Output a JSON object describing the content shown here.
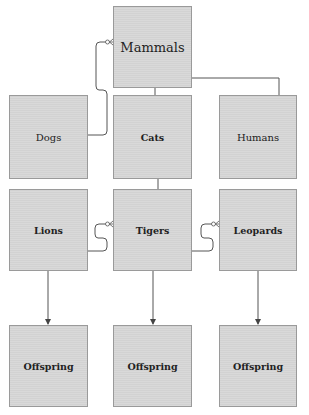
{
  "diagram": {
    "nodes": [
      {
        "id": "mammals",
        "label": "Mammals",
        "style": "title"
      },
      {
        "id": "dogs",
        "label": "Dogs",
        "style": "plain"
      },
      {
        "id": "cats",
        "label": "Cats",
        "style": "bold"
      },
      {
        "id": "humans",
        "label": "Humans",
        "style": "plain"
      },
      {
        "id": "lions",
        "label": "Lions",
        "style": "bold"
      },
      {
        "id": "tigers",
        "label": "Tigers",
        "style": "bold"
      },
      {
        "id": "leopards",
        "label": "Leopards",
        "style": "bold"
      },
      {
        "id": "offspring1",
        "label": "Offspring",
        "style": "bold"
      },
      {
        "id": "offspring2",
        "label": "Offspring",
        "style": "bold"
      },
      {
        "id": "offspring3",
        "label": "Offspring",
        "style": "bold"
      }
    ],
    "edges": [
      {
        "from": "dogs",
        "to": "mammals",
        "type": "zero-or-many"
      },
      {
        "from": "humans",
        "to": "mammals",
        "type": "zero-or-many"
      },
      {
        "from": "mammals",
        "to": "cats",
        "type": "line"
      },
      {
        "from": "cats",
        "to": "tigers",
        "type": "line"
      },
      {
        "from": "lions",
        "to": "tigers",
        "type": "zero-or-many"
      },
      {
        "from": "tigers",
        "to": "leopards",
        "type": "zero-or-many"
      },
      {
        "from": "lions",
        "to": "offspring1",
        "type": "arrow"
      },
      {
        "from": "tigers",
        "to": "offspring2",
        "type": "arrow"
      },
      {
        "from": "leopards",
        "to": "offspring3",
        "type": "arrow"
      }
    ],
    "colors": {
      "node_fill": "#d6d6d6",
      "node_border": "#9a9a9a",
      "edge": "#555555",
      "text": "#222222"
    }
  }
}
